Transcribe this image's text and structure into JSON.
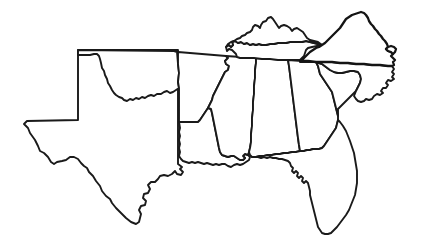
{
  "figure": {
    "kind": "outline-map",
    "title": "Map of the Southeastern United States",
    "subject_region": "Southeastern United States",
    "background_color": "#ffffff",
    "outline_color": "#1a1a1a",
    "outline_width_px": 1.9,
    "width_px": 422,
    "height_px": 251,
    "has_labels": false,
    "has_legend": false,
    "has_title_text": false
  },
  "highlight": {
    "state": "Virginia",
    "style": "diagonal-hatch",
    "hatch_color": "#141414",
    "hatch_background": "#ffffff",
    "hatch_angle_deg": 55,
    "hatch_spacing_px": 3,
    "hatch_line_width_px": 1.5,
    "outline_color": "#141414",
    "outline_width_px": 2.3
  },
  "states": [
    {
      "id": "texas",
      "name": "Texas",
      "highlighted": false
    },
    {
      "id": "oklahoma",
      "name": "Oklahoma",
      "highlighted": false
    },
    {
      "id": "arkansas",
      "name": "Arkansas",
      "highlighted": false
    },
    {
      "id": "louisiana",
      "name": "Louisiana",
      "highlighted": false
    },
    {
      "id": "mississippi",
      "name": "Mississippi",
      "highlighted": false
    },
    {
      "id": "alabama",
      "name": "Alabama",
      "highlighted": false
    },
    {
      "id": "tennessee",
      "name": "Tennessee",
      "highlighted": false
    },
    {
      "id": "kentucky",
      "name": "Kentucky",
      "highlighted": false
    },
    {
      "id": "georgia",
      "name": "Georgia",
      "highlighted": false
    },
    {
      "id": "florida",
      "name": "Florida",
      "highlighted": false
    },
    {
      "id": "south-carolina",
      "name": "South Carolina",
      "highlighted": false
    },
    {
      "id": "north-carolina",
      "name": "North Carolina",
      "highlighted": false
    },
    {
      "id": "virginia",
      "name": "Virginia",
      "highlighted": true
    }
  ]
}
